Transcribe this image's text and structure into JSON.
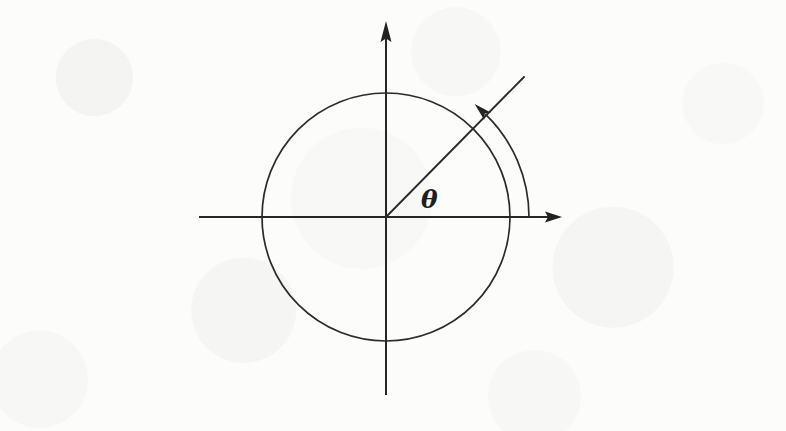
{
  "figure": {
    "background_color": "#fcfcfb",
    "ink_color": "#2b2b2b",
    "width": 786,
    "height": 431
  },
  "labels": {
    "angle_symbol": "θ"
  },
  "icons": {
    "x_axis_arrowhead": "arrow-right-icon",
    "y_axis_arrowhead": "arrow-up-icon",
    "arc_arrowhead": "arrow-counterclockwise-icon"
  },
  "chart_data": {
    "type": "scatter",
    "xlabel": "",
    "ylabel": "",
    "grid": false,
    "legend": null,
    "origin": {
      "x": 386,
      "y": 217
    },
    "axes": {
      "x_axis": {
        "x_start": 199,
        "x_end": 562,
        "y": 217,
        "arrow_at": "end"
      },
      "y_axis": {
        "y_start": 395,
        "y_end": 22,
        "x": 386,
        "arrow_at": "top"
      }
    },
    "circle": {
      "center": [
        386,
        217
      ],
      "radius": 124,
      "label": "unit circle"
    },
    "terminal_ray": {
      "from": [
        386,
        217
      ],
      "to": [
        524,
        77
      ],
      "angle_degrees": 45.4
    },
    "angle_arc": {
      "center": [
        386,
        217
      ],
      "radius": 143,
      "start_angle_degrees": 0,
      "end_angle_degrees": 46,
      "direction": "counterclockwise",
      "arrow_at": "end",
      "label": "θ"
    },
    "annotations": [
      {
        "text": "θ",
        "x": 421,
        "y": 208,
        "description": "angle label between positive x-axis and terminal ray"
      }
    ]
  }
}
